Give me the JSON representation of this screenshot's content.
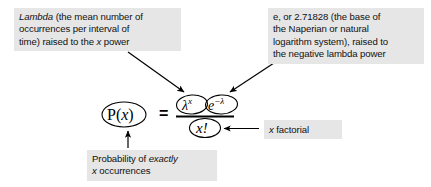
{
  "figure": {
    "background_color": "#ffffff",
    "note_background_color": "#e6e6e6",
    "ink_color": "#000000"
  },
  "notes": {
    "lambda": {
      "name": "lambda-note",
      "line1_italic": "Lambda",
      "line1_rest": " (the mean number of",
      "line2": "occurrences per interval of",
      "line3_a": "time) raised to the ",
      "line3_italic": "x",
      "line3_b": " power",
      "plain_text": "Lambda (the mean number of occurrences per interval of time) raised to the x power"
    },
    "e": {
      "name": "e-note",
      "line1": "e, or 2.71828 (the base of",
      "line2": "the Naperian or natural",
      "line3": "logarithm system), raised to",
      "line4": "the negative lambda power",
      "plain_text": "e, or 2.71828 (the base of the Naperian or natural logarithm system), raised to the negative lambda power"
    },
    "factorial": {
      "name": "factorial-note",
      "italic": "x",
      "rest": " factorial",
      "plain_text": "x factorial"
    },
    "probability": {
      "name": "probability-note",
      "line1_a": "Probability of ",
      "line1_italic": "exactly",
      "line2_italic": "x",
      "line2_rest": " occurrences",
      "plain_text": "Probability of exactly x occurrences"
    }
  },
  "formula": {
    "expression": "P(x) = (lambda^x * e^-lambda) / x!",
    "left_side": "P(x)",
    "left_side_base": "P(",
    "left_side_var": "x",
    "left_side_close": ")",
    "equals": "=",
    "numerator_term_1_base": "λ",
    "numerator_term_1_exponent": "x",
    "numerator_term_2_base": "e",
    "numerator_term_2_exponent": "−λ",
    "denominator": "x!",
    "fraction_bar": "—"
  },
  "arrows": [
    {
      "name": "arrow-lambda-note-to-lambda-term",
      "from": "lambda-note",
      "to": "lambda-term",
      "direction": "down-right"
    },
    {
      "name": "arrow-e-note-to-e-term",
      "from": "e-note",
      "to": "e-term",
      "direction": "down-left"
    },
    {
      "name": "arrow-factorial-note-to-factorial-term",
      "from": "factorial-note",
      "to": "factorial-term",
      "direction": "left"
    },
    {
      "name": "arrow-probability-note-to-px-term",
      "from": "probability-note",
      "to": "px-term",
      "direction": "up"
    }
  ],
  "circles": [
    {
      "name": "ellipse-px",
      "around": "P(x)"
    },
    {
      "name": "ellipse-lambda",
      "around": "lambda^x"
    },
    {
      "name": "ellipse-e",
      "around": "e^-lambda"
    },
    {
      "name": "ellipse-factorial",
      "around": "x!"
    }
  ]
}
